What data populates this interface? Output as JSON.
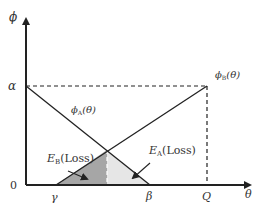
{
  "diagram": {
    "y_axis_label": "ϕ",
    "x_axis_label": "θ",
    "origin_label": "0",
    "alpha_label": "α",
    "x_ticks": {
      "gamma": "γ",
      "beta": "β",
      "Q": "Q"
    },
    "curves": {
      "phi_A": {
        "sym": "ϕ",
        "sub": "A",
        "arg": "(θ)"
      },
      "phi_B": {
        "sym": "ϕ",
        "sub": "B",
        "arg": "(θ)"
      }
    },
    "regions": {
      "E_B": {
        "sym": "E",
        "sub": "B",
        "text": "(Loss)",
        "fill": "#a6a6a6"
      },
      "E_A": {
        "sym": "E",
        "sub": "A",
        "text": "(Loss)",
        "fill": "#e6e6e6"
      }
    },
    "colors": {
      "line": "#222222",
      "text": "#333333"
    }
  }
}
